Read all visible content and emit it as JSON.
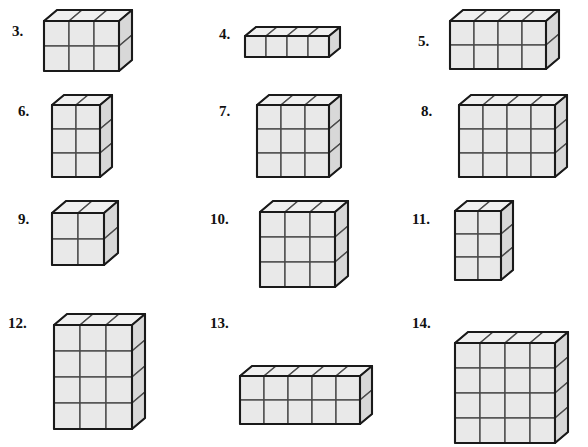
{
  "page": {
    "background_color": "#ffffff",
    "width": 588,
    "height": 400
  },
  "style": {
    "cube_face_front": "#e9e9e9",
    "cube_face_top": "#f0f0f0",
    "cube_face_side": "#d8d8d8",
    "cube_outline": "#1a1a1a",
    "cube_gridline": "#4a4a4a",
    "number_color": "#111111"
  },
  "problems": [
    {
      "id": "problem-3",
      "label": "3.",
      "number_x": 12,
      "number_y": 24,
      "fig_x": 42,
      "fig_y": 8,
      "cell": 25,
      "dx": 13,
      "dy": -11,
      "cols": 3,
      "rows": 2,
      "depth": 1
    },
    {
      "id": "problem-4",
      "label": "4.",
      "number_x": 219,
      "number_y": 27,
      "fig_x": 243,
      "fig_y": 25,
      "cell": 21,
      "dx": 11,
      "dy": -9,
      "cols": 4,
      "rows": 1,
      "depth": 1
    },
    {
      "id": "problem-5",
      "label": "5.",
      "number_x": 418,
      "number_y": 34,
      "fig_x": 448,
      "fig_y": 8,
      "cell": 24,
      "dx": 13,
      "dy": -11,
      "cols": 4,
      "rows": 2,
      "depth": 1
    },
    {
      "id": "problem-6",
      "label": "6.",
      "number_x": 18,
      "number_y": 104,
      "fig_x": 50,
      "fig_y": 93,
      "cell": 24,
      "dx": 12,
      "dy": -10,
      "cols": 2,
      "rows": 3,
      "depth": 1
    },
    {
      "id": "problem-7",
      "label": "7.",
      "number_x": 219,
      "number_y": 104,
      "fig_x": 255,
      "fig_y": 93,
      "cell": 24,
      "dx": 12,
      "dy": -10,
      "cols": 3,
      "rows": 3,
      "depth": 1
    },
    {
      "id": "problem-8",
      "label": "8.",
      "number_x": 421,
      "number_y": 104,
      "fig_x": 457,
      "fig_y": 93,
      "cell": 24,
      "dx": 12,
      "dy": -10,
      "cols": 4,
      "rows": 3,
      "depth": 1
    },
    {
      "id": "problem-9",
      "label": "9.",
      "number_x": 18,
      "number_y": 212,
      "fig_x": 50,
      "fig_y": 199,
      "cell": 26,
      "dx": 14,
      "dy": -12,
      "cols": 2,
      "rows": 2,
      "depth": 1
    },
    {
      "id": "problem-10",
      "label": "10.",
      "number_x": 210,
      "number_y": 212,
      "fig_x": 258,
      "fig_y": 199,
      "cell": 25,
      "dx": 13,
      "dy": -11,
      "cols": 3,
      "rows": 3,
      "depth": 1
    },
    {
      "id": "problem-11",
      "label": "11.",
      "number_x": 412,
      "number_y": 212,
      "fig_x": 453,
      "fig_y": 199,
      "cell": 23,
      "dx": 12,
      "dy": -10,
      "cols": 2,
      "rows": 3,
      "depth": 1
    },
    {
      "id": "problem-12",
      "label": "12.",
      "number_x": 8,
      "number_y": 316,
      "fig_x": 52,
      "fig_y": 312,
      "cell": 26,
      "dx": 13,
      "dy": -11,
      "cols": 3,
      "rows": 4,
      "depth": 1
    },
    {
      "id": "problem-13",
      "label": "13.",
      "number_x": 210,
      "number_y": 316,
      "fig_x": 238,
      "fig_y": 364,
      "cell": 24,
      "dx": 12,
      "dy": -10,
      "cols": 5,
      "rows": 2,
      "depth": 1
    },
    {
      "id": "problem-14",
      "label": "14.",
      "number_x": 412,
      "number_y": 316,
      "fig_x": 453,
      "fig_y": 330,
      "cell": 25,
      "dx": 13,
      "dy": -11,
      "cols": 4,
      "rows": 4,
      "depth": 1
    }
  ]
}
